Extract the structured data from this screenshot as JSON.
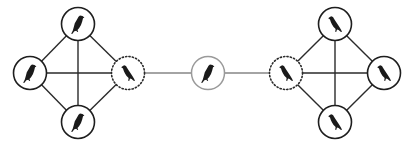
{
  "diagram": {
    "type": "network",
    "colors": {
      "edge": "#2a2a2a",
      "node_border": "#1e1e1e",
      "bridge_node_border": "#9a9a9a",
      "icon": "#1a1a1a"
    },
    "nodes": [
      {
        "id": "L-top",
        "cluster": "left",
        "style": "solid",
        "icon": "bird-icon",
        "facing": "left"
      },
      {
        "id": "L-left",
        "cluster": "left",
        "style": "solid",
        "icon": "bird-icon",
        "facing": "left"
      },
      {
        "id": "L-bottom",
        "cluster": "left",
        "style": "solid",
        "icon": "bird-icon",
        "facing": "left"
      },
      {
        "id": "L-gateway",
        "cluster": "left",
        "style": "dotted",
        "icon": "bird-icon",
        "facing": "right"
      },
      {
        "id": "center",
        "cluster": "bridge",
        "style": "gray",
        "icon": "bird-icon",
        "facing": "left"
      },
      {
        "id": "R-gateway",
        "cluster": "right",
        "style": "dotted",
        "icon": "bird-icon",
        "facing": "right"
      },
      {
        "id": "R-top",
        "cluster": "right",
        "style": "solid",
        "icon": "bird-icon",
        "facing": "right"
      },
      {
        "id": "R-right",
        "cluster": "right",
        "style": "solid",
        "icon": "bird-icon",
        "facing": "right"
      },
      {
        "id": "R-bottom",
        "cluster": "right",
        "style": "solid",
        "icon": "bird-icon",
        "facing": "right"
      }
    ],
    "edges": [
      [
        "L-top",
        "L-left"
      ],
      [
        "L-top",
        "L-bottom"
      ],
      [
        "L-top",
        "L-gateway"
      ],
      [
        "L-left",
        "L-bottom"
      ],
      [
        "L-left",
        "L-gateway"
      ],
      [
        "L-bottom",
        "L-gateway"
      ],
      [
        "L-gateway",
        "center"
      ],
      [
        "center",
        "R-gateway"
      ],
      [
        "R-gateway",
        "R-top"
      ],
      [
        "R-gateway",
        "R-right"
      ],
      [
        "R-gateway",
        "R-bottom"
      ],
      [
        "R-top",
        "R-right"
      ],
      [
        "R-top",
        "R-bottom"
      ],
      [
        "R-right",
        "R-bottom"
      ]
    ]
  }
}
